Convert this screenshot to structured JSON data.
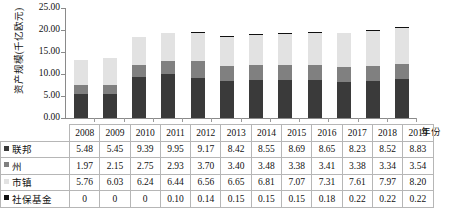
{
  "chart_data": {
    "type": "bar",
    "subtype": "stacked-column-with-data-table",
    "title": "",
    "xlabel": "年份",
    "ylabel": "资产规模(千亿欧元)",
    "ylim": [
      0,
      25
    ],
    "ytick_step": 5,
    "ytick_labels": [
      "25.00",
      "20.00",
      "15.00",
      "10.00",
      "5.00",
      "0.00"
    ],
    "grid": false,
    "legend_position": "table-row-headers",
    "categories": [
      "2008",
      "2009",
      "2010",
      "2011",
      "2012",
      "2013",
      "2014",
      "2015",
      "2016",
      "2017",
      "2018",
      "2019"
    ],
    "series": [
      {
        "name": "联邦",
        "color": "#3a3a3a",
        "values": [
          5.48,
          5.45,
          9.39,
          9.95,
          9.17,
          8.42,
          8.55,
          8.69,
          8.65,
          8.23,
          8.52,
          8.83
        ]
      },
      {
        "name": "州",
        "color": "#808080",
        "values": [
          1.97,
          2.15,
          2.75,
          2.93,
          3.7,
          3.4,
          3.48,
          3.38,
          3.41,
          3.38,
          3.34,
          3.54
        ]
      },
      {
        "name": "市镇",
        "color": "#e2e2e2",
        "values": [
          5.76,
          6.03,
          6.24,
          6.44,
          6.56,
          6.65,
          6.81,
          7.07,
          7.31,
          7.61,
          7.97,
          8.2
        ]
      },
      {
        "name": "社保基金",
        "color": "#101010",
        "values": [
          0,
          0,
          0,
          0.1,
          0.14,
          0.15,
          0.15,
          0.15,
          0.18,
          0.22,
          0.22,
          0.22
        ]
      }
    ],
    "value_labels": [
      [
        "5.48",
        "5.45",
        "9.39",
        "9.95",
        "9.17",
        "8.42",
        "8.55",
        "8.69",
        "8.65",
        "8.23",
        "8.52",
        "8.83"
      ],
      [
        "1.97",
        "2.15",
        "2.75",
        "2.93",
        "3.70",
        "3.40",
        "3.48",
        "3.38",
        "3.41",
        "3.38",
        "3.34",
        "3.54"
      ],
      [
        "5.76",
        "6.03",
        "6.24",
        "6.44",
        "6.56",
        "6.65",
        "6.81",
        "7.07",
        "7.31",
        "7.61",
        "7.97",
        "8.20"
      ],
      [
        "0",
        "0",
        "0",
        "0.10",
        "0.14",
        "0.15",
        "0.15",
        "0.15",
        "0.18",
        "0.22",
        "0.22",
        "0.22"
      ]
    ]
  }
}
